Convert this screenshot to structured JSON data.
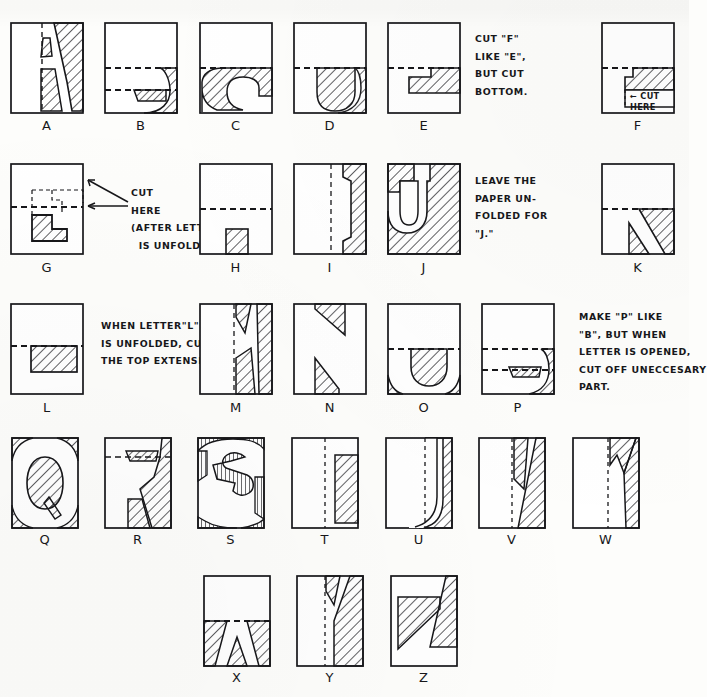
{
  "document": {
    "title": "Paper-Folding Alphabet Cutting Guide",
    "description": "Hand-drawn chart showing how each letter of the alphabet is cut from folded paper; hatched areas are the parts cut away, dashed lines are fold / cut lines."
  },
  "style": {
    "ink": "#17171a",
    "paper": "#fdfdfb",
    "hatch": "#2a2a2e"
  },
  "rows": [
    {
      "id": "row-1",
      "letters": [
        "A",
        "B",
        "C",
        "D",
        "E",
        "F"
      ]
    },
    {
      "id": "row-2",
      "letters": [
        "G",
        "H",
        "I",
        "J",
        "K"
      ]
    },
    {
      "id": "row-3",
      "letters": [
        "L",
        "M",
        "N",
        "O",
        "P"
      ]
    },
    {
      "id": "row-4",
      "letters": [
        "Q",
        "R",
        "S",
        "T",
        "U",
        "V",
        "W"
      ]
    },
    {
      "id": "row-5",
      "letters": [
        "X",
        "Y",
        "Z"
      ]
    }
  ],
  "captions": {
    "A": "A",
    "B": "B",
    "C": "C",
    "D": "D",
    "E": "E",
    "F": "F",
    "G": "G",
    "H": "H",
    "I": "I",
    "J": "J",
    "K": "K",
    "L": "L",
    "M": "M",
    "N": "N",
    "O": "O",
    "P": "P",
    "Q": "Q",
    "R": "R",
    "S": "S",
    "T": "T",
    "U": "U",
    "V": "V",
    "W": "W",
    "X": "X",
    "Y": "Y",
    "Z": "Z"
  },
  "notes": {
    "f_note": "CUT \"F\"\nLIKE \"E\",\nBUT CUT\nBOTTOM.",
    "f_inline": "CUT\nHERE",
    "f_inline_arrow": "←",
    "g_note": "CUT\nHERE\n(AFTER LETTER\n  IS UNFOLDED)",
    "k_note": "LEAVE THE\nPAPER UN-\nFOLDED FOR\n\"J.\"",
    "l_note": "WHEN LETTER\"L\"\nIS UNFOLDED, CUT\nTHE TOP EXTENSION.",
    "p_note": "MAKE \"P\" LIKE\n\"B\", BUT WHEN\nLETTER IS OPENED,\nCUT OFF UNECCESARY\nPART."
  }
}
